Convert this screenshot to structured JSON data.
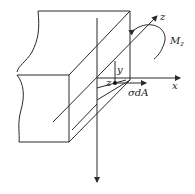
{
  "diagram": {
    "title": "",
    "labels": {
      "z_axis": "z",
      "x_axis": "x",
      "y_axis": "y",
      "z_coord": "z",
      "moment": "M",
      "moment_sub": "z",
      "stress_element": "σdA"
    },
    "colors": {
      "stroke": "#2a2a2a",
      "background": "#ffffff"
    }
  }
}
